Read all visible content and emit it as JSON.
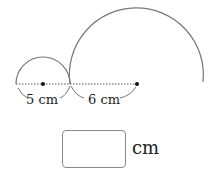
{
  "diagram": {
    "small_circle": {
      "center": [
        43,
        84
      ],
      "radius": 27,
      "label": "5 cm"
    },
    "large_circle": {
      "center": [
        137,
        84
      ],
      "radius": 67,
      "label": "6 cm"
    },
    "stroke_color": "#777777",
    "dot_color": "#111111"
  },
  "labels": {
    "small_radius": "5 cm",
    "large_radius": "6 cm"
  },
  "answer": {
    "value": "",
    "unit": "cm"
  }
}
